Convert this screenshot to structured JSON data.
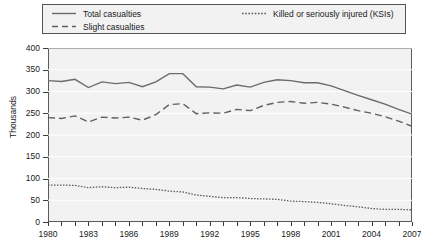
{
  "chart_data": {
    "type": "line",
    "title": "",
    "xlabel": "",
    "ylabel": "Thousands",
    "ylim": [
      0,
      400
    ],
    "ytick_step": 50,
    "yticks": [
      "0",
      "50",
      "100",
      "150",
      "200",
      "250",
      "300",
      "350",
      "400"
    ],
    "xlim": [
      1980,
      2007
    ],
    "x": [
      1980,
      1981,
      1982,
      1983,
      1984,
      1985,
      1986,
      1987,
      1988,
      1989,
      1990,
      1991,
      1992,
      1993,
      1994,
      1995,
      1996,
      1997,
      1998,
      1999,
      2000,
      2001,
      2002,
      2003,
      2004,
      2005,
      2006,
      2007
    ],
    "xticks_labeled": [
      "1980",
      "1983",
      "1986",
      "1989",
      "1992",
      "1995",
      "1998",
      "2001",
      "2004",
      "2007"
    ],
    "grid": true,
    "legend_position": "top",
    "series": [
      {
        "name": "Total casualties",
        "style": "solid",
        "color": "#6b6b6b",
        "values": [
          325,
          323,
          328,
          309,
          322,
          318,
          321,
          311,
          322,
          341,
          341,
          311,
          310,
          306,
          315,
          310,
          321,
          327,
          325,
          320,
          320,
          313,
          302,
          291,
          281,
          271,
          259,
          248
        ]
      },
      {
        "name": "Slight casualties",
        "style": "dashed",
        "color": "#5f5f5f",
        "values": [
          240,
          238,
          244,
          230,
          241,
          239,
          241,
          234,
          247,
          270,
          272,
          249,
          251,
          250,
          259,
          256,
          268,
          275,
          277,
          273,
          275,
          271,
          264,
          256,
          250,
          242,
          232,
          220
        ]
      },
      {
        "name": "Killed or seriously injured (KSIs)",
        "style": "dotted",
        "color": "#5a5a5a",
        "values": [
          85,
          85,
          84,
          79,
          81,
          79,
          80,
          77,
          75,
          71,
          69,
          62,
          59,
          56,
          56,
          54,
          53,
          52,
          48,
          47,
          45,
          42,
          38,
          35,
          31,
          29,
          29,
          28
        ]
      }
    ]
  }
}
